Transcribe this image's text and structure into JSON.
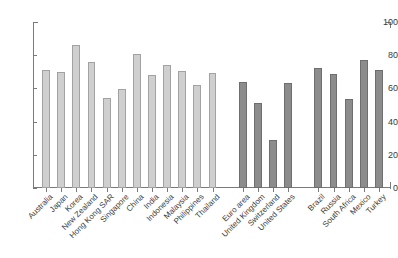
{
  "chart_data": {
    "type": "bar",
    "title": "",
    "subtitle": "",
    "xlabel": "",
    "ylabel": "",
    "ylim": [
      0,
      100
    ],
    "ytick_labels": [
      "0",
      "20",
      "40",
      "60",
      "80",
      "100"
    ],
    "ytick_values": [
      0,
      20,
      40,
      60,
      80,
      100
    ],
    "grid": false,
    "legend_position": "none",
    "categories": [
      "Australia",
      "Japan",
      "Korea",
      "New Zealand",
      "Hong Kong SAR",
      "Singapore",
      "China",
      "India",
      "Indonesia",
      "Malaysia",
      "Philippines",
      "Thailand",
      "Euro area",
      "United Kingdom",
      "Switzerland",
      "United States",
      "Brazil",
      "Russia",
      "South Africa",
      "Mexico",
      "Turkey"
    ],
    "values": [
      71,
      70,
      86,
      76,
      54,
      59.5,
      80.5,
      68,
      74,
      70.5,
      62,
      69,
      64,
      51,
      29,
      63,
      72,
      68.5,
      53.5,
      77,
      71
    ],
    "groups": [
      {
        "name": "Asia-Pacific",
        "color": "#cfcfcf",
        "style": "light",
        "start_index": 0,
        "count": 12
      },
      {
        "name": "Advanced economies",
        "color": "#8c8c8c",
        "style": "dark",
        "start_index": 12,
        "count": 4
      },
      {
        "name": "Other emerging markets",
        "color": "#8c8c8c",
        "style": "dark",
        "start_index": 16,
        "count": 5
      }
    ],
    "colors": {
      "light_bar_fill": "#cfcfcf",
      "light_bar_edge": "#a2a2a2",
      "dark_bar_fill": "#8c8c8c",
      "dark_bar_edge": "#6e6e6e",
      "axis": "#7a7a7a",
      "text": "#3d3d3d",
      "background": "#ffffff"
    }
  }
}
